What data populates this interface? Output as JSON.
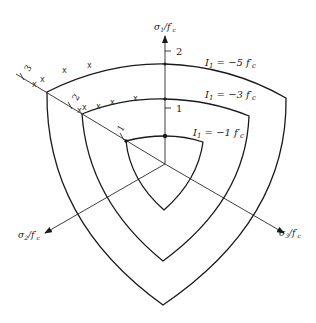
{
  "figure": {
    "type": "failure-surface-deviatoric-section",
    "axes": {
      "sigma1": {
        "label_main": "σ",
        "label_sub": "1",
        "label_tail": "/f′",
        "label_tail_sub": "c",
        "ticks": [
          "2",
          "1"
        ]
      },
      "sigma2": {
        "label_main": "σ",
        "label_sub": "2",
        "label_tail": "/f′",
        "label_tail_sub": "c"
      },
      "sigma3": {
        "label_main": "σ",
        "label_sub": "3",
        "label_tail": "/f′",
        "label_tail_sub": "c"
      },
      "hydrostatic": {
        "ticks": [
          "1",
          "2",
          "3"
        ]
      }
    },
    "curves": [
      {
        "id": "outer",
        "label_main": "I",
        "label_sub": "1",
        "label_eq": " = −5 f′",
        "label_sub2": "c"
      },
      {
        "id": "middle",
        "label_main": "I",
        "label_sub": "1",
        "label_eq": " = −3 f′",
        "label_sub2": "c"
      },
      {
        "id": "inner",
        "label_main": "I",
        "label_sub": "1",
        "label_eq": " = −1 f′",
        "label_sub2": "c"
      }
    ],
    "markers": {
      "symbol": "x"
    },
    "color": "#1a1a1a"
  }
}
